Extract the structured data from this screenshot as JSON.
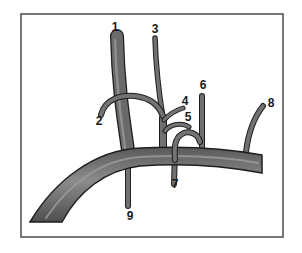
{
  "diagram": {
    "type": "anatomical vessel branching illustration",
    "colors": {
      "vessel_fill": "#6e6e6e",
      "vessel_highlight": "#9a9a9a",
      "vessel_outline": "#1e1e1e",
      "frame": "#555555",
      "background": "#ffffff",
      "label": "#1a1a1a"
    },
    "labels": [
      {
        "id": "1",
        "text": "1"
      },
      {
        "id": "2",
        "text": "2"
      },
      {
        "id": "3",
        "text": "3"
      },
      {
        "id": "4",
        "text": "4"
      },
      {
        "id": "5",
        "text": "5"
      },
      {
        "id": "6",
        "text": "6"
      },
      {
        "id": "7",
        "text": "7"
      },
      {
        "id": "8",
        "text": "8"
      },
      {
        "id": "9",
        "text": "9"
      }
    ]
  }
}
